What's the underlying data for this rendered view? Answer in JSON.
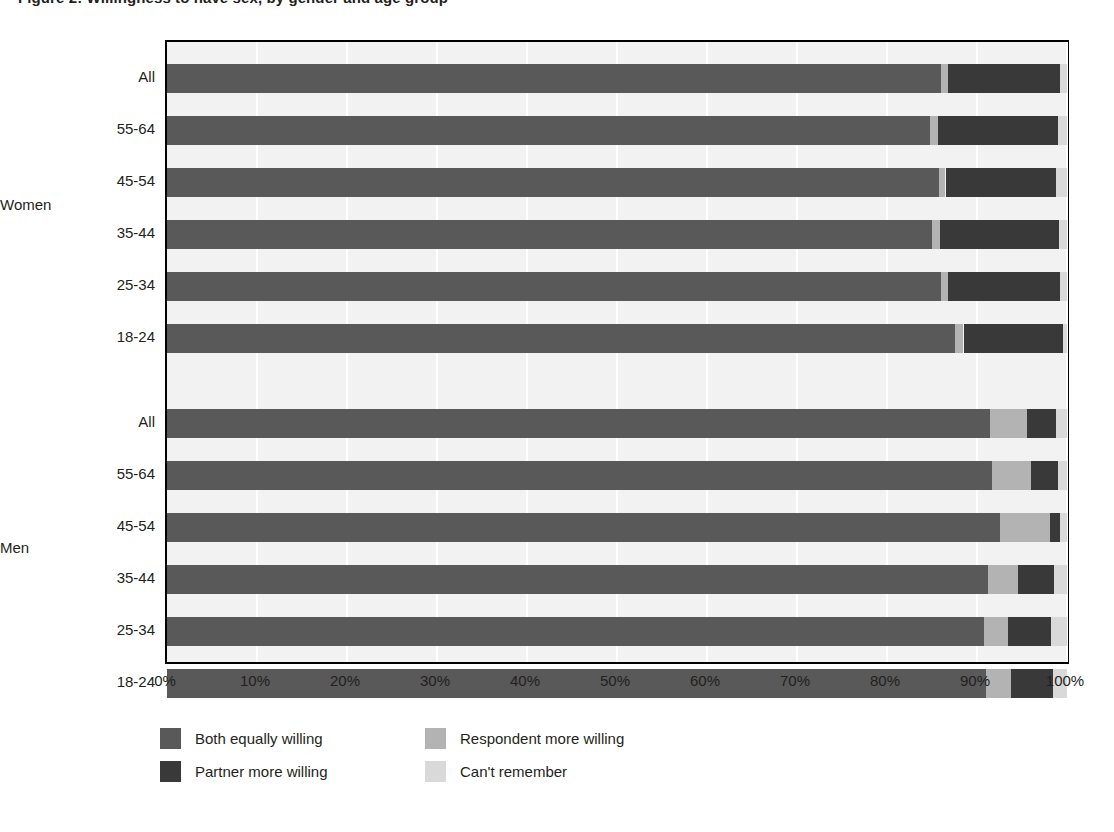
{
  "title": "Figure 2: Willingness to have sex, by gender and age group",
  "axis": {
    "xticks": [
      "0%",
      "10%",
      "20%",
      "30%",
      "40%",
      "50%",
      "60%",
      "70%",
      "80%",
      "90%",
      "100%"
    ],
    "xmin": 0,
    "xmax": 100
  },
  "groups": [
    {
      "name": "Women",
      "label": "Women"
    },
    {
      "name": "Men",
      "label": "Men"
    }
  ],
  "legend": [
    {
      "key": "both",
      "label": "Both equally willing",
      "color": "#595959"
    },
    {
      "key": "partner",
      "label": "Partner more willing",
      "color": "#393939"
    },
    {
      "key": "respondent",
      "label": "Respondent more willing",
      "color": "#b3b3b3"
    },
    {
      "key": "cant",
      "label": "Can't remember",
      "color": "#d9d9d9"
    }
  ],
  "colors": {
    "both": "#595959",
    "partner": "#393939",
    "respondent": "#b3b3b3",
    "cant": "#d9d9d9",
    "plot_background": "#f2f2f2",
    "gridline": "#ffffff",
    "axis": "#000000",
    "text": "#231f20"
  },
  "chart_data": {
    "type": "bar",
    "orientation": "horizontal",
    "stacked": true,
    "normalized": true,
    "title": "Figure 2: Willingness to have sex, by gender and age group",
    "xlabel": "",
    "ylabel": "",
    "xlim": [
      0,
      100
    ],
    "xticks": [
      0,
      10,
      20,
      30,
      40,
      50,
      60,
      70,
      80,
      90,
      100
    ],
    "grid": "vertical",
    "legend_position": "bottom-left",
    "series": [
      {
        "name": "Both equally willing",
        "key": "both"
      },
      {
        "name": "Partner more willing",
        "key": "partner"
      },
      {
        "name": "Respondent more willing",
        "key": "respondent"
      },
      {
        "name": "Can't remember",
        "key": "cant"
      }
    ],
    "rows": [
      {
        "group": "Women",
        "category": "All",
        "both": 86.0,
        "respondent": 0.8,
        "partner": 12.4,
        "cant": 0.8
      },
      {
        "group": "Women",
        "category": "55-64",
        "both": 84.8,
        "respondent": 0.9,
        "partner": 13.3,
        "cant": 1.0
      },
      {
        "group": "Women",
        "category": "45-54",
        "both": 85.8,
        "respondent": 0.7,
        "partner": 12.3,
        "cant": 1.2
      },
      {
        "group": "Women",
        "category": "35-44",
        "both": 85.0,
        "respondent": 0.9,
        "partner": 13.2,
        "cant": 0.9
      },
      {
        "group": "Women",
        "category": "25-34",
        "both": 86.0,
        "respondent": 0.8,
        "partner": 12.4,
        "cant": 0.8
      },
      {
        "group": "Women",
        "category": "18-24",
        "both": 87.6,
        "respondent": 0.9,
        "partner": 11.0,
        "cant": 0.5
      },
      {
        "group": "Men",
        "category": "All",
        "both": 91.4,
        "respondent": 4.2,
        "partner": 3.2,
        "cant": 1.2
      },
      {
        "group": "Men",
        "category": "55-64",
        "both": 91.7,
        "respondent": 4.3,
        "partner": 3.0,
        "cant": 1.0
      },
      {
        "group": "Men",
        "category": "45-54",
        "both": 92.5,
        "respondent": 5.6,
        "partner": 1.1,
        "cant": 0.8
      },
      {
        "group": "Men",
        "category": "35-44",
        "both": 91.2,
        "respondent": 3.4,
        "partner": 4.0,
        "cant": 1.4
      },
      {
        "group": "Men",
        "category": "25-34",
        "both": 90.8,
        "respondent": 2.6,
        "partner": 4.8,
        "cant": 1.8
      },
      {
        "group": "Men",
        "category": "18-24",
        "both": 91.0,
        "respondent": 2.8,
        "partner": 4.6,
        "cant": 1.6
      }
    ]
  },
  "layout": {
    "row_tops": [
      22,
      74,
      126,
      178,
      230,
      282,
      367,
      419,
      471,
      523,
      575,
      627
    ],
    "group_label_tops": [
      157,
      500
    ]
  }
}
